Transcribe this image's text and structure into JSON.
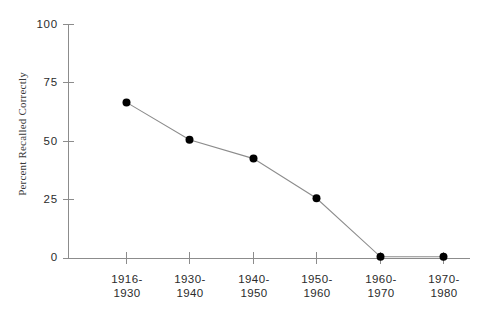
{
  "chart_data": {
    "type": "line",
    "title": "",
    "xlabel": "",
    "ylabel": "Percent Recalled Correctly",
    "categories": [
      "1916-\n1930",
      "1930-\n1940",
      "1940-\n1950",
      "1950-\n1960",
      "1960-\n1970",
      "1970-\n1980"
    ],
    "category_lines": [
      [
        "1916-",
        "1930"
      ],
      [
        "1930-",
        "1940"
      ],
      [
        "1940-",
        "1950"
      ],
      [
        "1950-",
        "1960"
      ],
      [
        "1960-",
        "1970"
      ],
      [
        "1970-",
        "1980"
      ]
    ],
    "values": [
      66.5,
      50.5,
      42.5,
      25.5,
      0.5,
      0.5
    ],
    "ylim": [
      0,
      100
    ],
    "yticks": [
      0,
      25,
      50,
      75,
      100
    ],
    "ytick_labels": [
      "0",
      "25",
      "50",
      "75",
      "100"
    ],
    "grid": false,
    "legend": null,
    "marker": "filled-circle",
    "marker_color": "#000000",
    "line_color": "#8c8c8c",
    "axis_color": "#8c8c8c",
    "background": "#ffffff"
  }
}
